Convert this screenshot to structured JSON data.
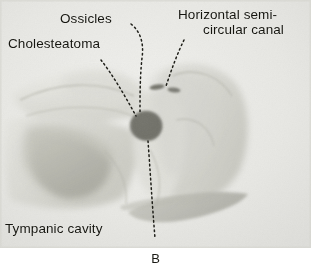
{
  "figure": {
    "caption": "B",
    "panel_letter": "B",
    "background_color": "#ffffff",
    "photo_background_color": "#e9e9e6"
  },
  "annotations": [
    {
      "name": "ossicles",
      "text": "Ossicles",
      "leader": "dotted-curve"
    },
    {
      "name": "cholesteatoma",
      "text": "Cholesteatoma",
      "leader": "dotted-diagonal"
    },
    {
      "name": "horizontal-semicircular-canal",
      "text_line1": "Horizontal semi-",
      "text_line2": "circular canal",
      "leader": "dotted-diagonal"
    },
    {
      "name": "tympanic-cavity",
      "text": "Tympanic cavity",
      "leader": "dotted-vertical"
    }
  ],
  "specimen": {
    "description": "temporal bone dissection photograph",
    "dark_mass_color": "#7e7e77",
    "bone_mid_tone": "#d2d2cb",
    "bone_shadow_tone": "#b7b7ae"
  }
}
